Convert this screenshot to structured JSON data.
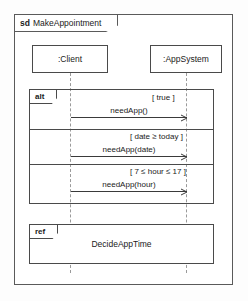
{
  "diagram": {
    "kind": "uml-sequence-diagram",
    "frame": {
      "keyword": "sd",
      "name": "MakeAppointment"
    },
    "lifelines": [
      {
        "id": "client",
        "label": ":Client"
      },
      {
        "id": "appsystem",
        "label": ":AppSystem"
      }
    ],
    "fragments": [
      {
        "id": "alt",
        "operator": "alt",
        "operands": [
          {
            "guard": "[ true ]",
            "message": {
              "label": "needApp()",
              "from": "client",
              "to": "appsystem"
            }
          },
          {
            "guard": "[ date ≥ today ]",
            "message": {
              "label": "needApp(date)",
              "from": "client",
              "to": "appsystem"
            }
          },
          {
            "guard": "[ 7 ≤ hour ≤ 17 ]",
            "message": {
              "label": "needApp(hour)",
              "from": "client",
              "to": "appsystem"
            }
          }
        ]
      },
      {
        "id": "ref",
        "operator": "ref",
        "body": "DecideAppTime"
      }
    ],
    "colors": {
      "frame_border": "#5a5a5a",
      "box_border": "#4a4a4a",
      "lifeline": "#9a9a9a",
      "arrow": "#3a3a3a",
      "background": "#ffffff",
      "text": "#1a1a1a"
    }
  }
}
